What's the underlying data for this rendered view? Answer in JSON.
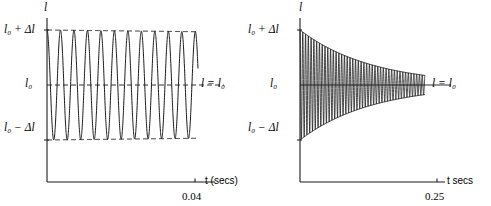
{
  "figure": {
    "background": "#ffffff",
    "stroke_color": "#1a1a1a",
    "panels": [
      {
        "id": "left",
        "y_axis_title": "l",
        "y_labels": {
          "top": "l₀ + Δl",
          "middle": "l₀",
          "bottom": "l₀ − Δl"
        },
        "equilibrium_label": "l = l₀",
        "x_axis_title": "t (secs)",
        "x_tick_label": "0.04"
      },
      {
        "id": "right",
        "y_axis_title": "l",
        "y_labels": {
          "top": "l₀ + Δl",
          "middle": "l₀",
          "bottom": "l₀ − Δl"
        },
        "equilibrium_label": "l = l₀",
        "x_axis_title": "t secs",
        "x_tick_label": "0.25"
      }
    ]
  },
  "chart_data": [
    {
      "type": "line",
      "id": "lightly-damped-oscillation",
      "title": "",
      "xlabel": "t (secs)",
      "ylabel": "l",
      "xlim": [
        0,
        0.04
      ],
      "ylim": [
        -1,
        1
      ],
      "ytick_labels": [
        "l₀ + Δl",
        "l₀",
        "l₀ − Δl"
      ],
      "ytick_values": [
        1,
        0,
        -1
      ],
      "xtick_labels": [
        "0.04"
      ],
      "xtick_values": [
        0.04
      ],
      "grid": false,
      "legend": false,
      "annotations": [
        "l = l₀"
      ],
      "series": [
        {
          "name": "displacement",
          "kind": "damped-sine",
          "amplitude": 1.0,
          "decay_rate": 20.0,
          "cycles": 11.2,
          "phase_deg": 90,
          "style": "solid"
        },
        {
          "name": "upper-envelope",
          "kind": "exponential-decay",
          "amplitude": 1.0,
          "decay_rate": 20.0,
          "style": "dashed"
        },
        {
          "name": "lower-envelope",
          "kind": "exponential-decay",
          "amplitude": -1.0,
          "decay_rate": 20.0,
          "style": "dashed"
        },
        {
          "name": "equilibrium",
          "kind": "horizontal-line",
          "value": 0,
          "style": "dashed"
        }
      ]
    },
    {
      "type": "line",
      "id": "heavily-damped-oscillation",
      "title": "",
      "xlabel": "t secs",
      "ylabel": "l",
      "xlim": [
        0,
        0.25
      ],
      "ylim": [
        -1,
        1
      ],
      "ytick_labels": [
        "l₀ + Δl",
        "l₀",
        "l₀ − Δl"
      ],
      "ytick_values": [
        1,
        0,
        -1
      ],
      "xtick_labels": [
        "0.25"
      ],
      "xtick_values": [
        0.25
      ],
      "grid": false,
      "legend": false,
      "annotations": [
        "l = l₀"
      ],
      "series": [
        {
          "name": "displacement",
          "kind": "damped-sine",
          "amplitude": 1.0,
          "decay_rate": 28.0,
          "cycles": 45.0,
          "phase_deg": 90,
          "style": "solid"
        },
        {
          "name": "upper-envelope",
          "kind": "exponential-decay",
          "amplitude": 1.0,
          "decay_rate": 28.0,
          "style": "solid"
        },
        {
          "name": "lower-envelope",
          "kind": "exponential-decay",
          "amplitude": -1.0,
          "decay_rate": 28.0,
          "style": "solid"
        },
        {
          "name": "equilibrium",
          "kind": "horizontal-line",
          "value": 0,
          "style": "solid"
        }
      ]
    }
  ]
}
